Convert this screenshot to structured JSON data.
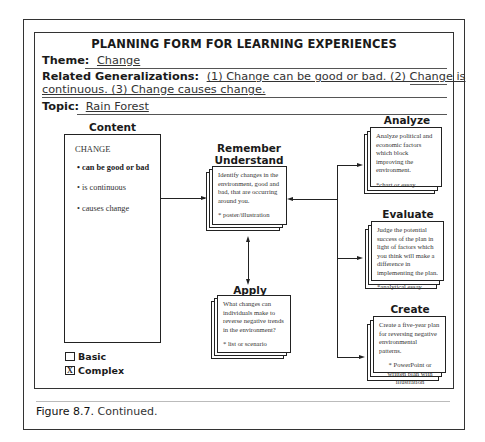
{
  "form": {
    "title": "PLANNING FORM FOR LEARNING EXPERIENCES",
    "theme_label": "Theme:",
    "theme_value": "Change",
    "generalizations_label": "Related Generalizations:",
    "generalizations_line1": "(1) Change can be good or bad.  (2) Change is",
    "generalizations_line2": "continuous.  (3) Change causes change.",
    "topic_label": "Topic:",
    "topic_value": "Rain Forest"
  },
  "content": {
    "heading": "Content",
    "title": "CHANGE",
    "items": [
      {
        "text": "• can be good or bad",
        "bold": true
      },
      {
        "text": "• is continuous",
        "bold": false
      },
      {
        "text": "• causes change",
        "bold": false
      }
    ]
  },
  "levels": {
    "remember": {
      "heading_line1": "Remember",
      "heading_line2": "Understand",
      "body": "Identify changes in the environment, good and bad, that are occurring around you.",
      "note": "* poster/illustration"
    },
    "apply": {
      "heading": "Apply",
      "body": "What changes can individuals make to reverse negative trends in the environment?",
      "note": "* list or scenario"
    },
    "analyze": {
      "heading": "Analyze",
      "body": "Analyze political and economic factors which block improving the environment.",
      "note": "*chart or essay"
    },
    "evaluate": {
      "heading": "Evaluate",
      "body": "Judge the potential success of the plan in light of factors which you think will make a difference in implementing the plan.",
      "note": "*analytical essay"
    },
    "create": {
      "heading": "Create",
      "body": "Create a five-year plan for reversing negative environmental patterns.",
      "note": "* PowerPoint or written plan with illustration"
    }
  },
  "complexity": {
    "basic_label": "Basic",
    "basic_mark": "",
    "complex_label": "Complex",
    "complex_mark": "X"
  },
  "caption": {
    "figure_number": "Figure 8.7.",
    "text": " Continued."
  }
}
